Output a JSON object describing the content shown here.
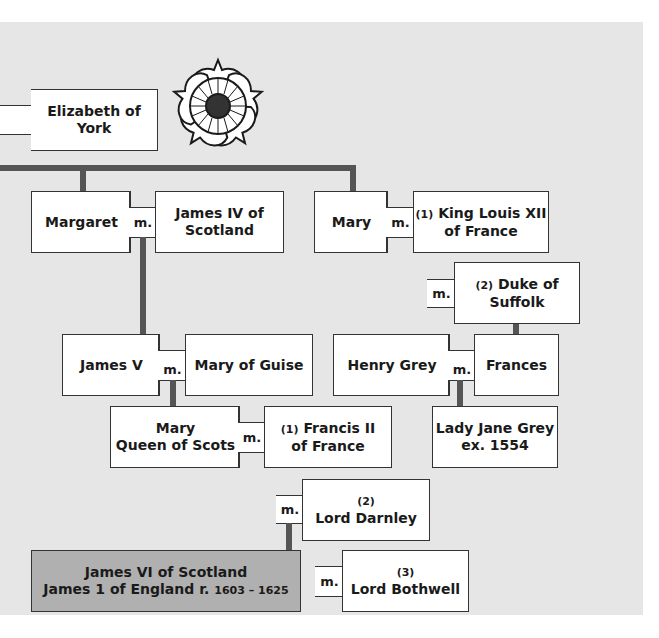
{
  "icon": "tudor-rose-icon",
  "colors": {
    "panel": "#e6e6e6",
    "line": "#555555",
    "highlight": "#b0b0b0",
    "border": "#333333"
  },
  "marriage_label": "m.",
  "people": {
    "elizabeth": {
      "line1": "Elizabeth of",
      "line2": "York"
    },
    "margaret": "Margaret",
    "james4": {
      "line1": "James IV of",
      "line2": "Scotland"
    },
    "mary_tudor": "Mary",
    "louis12": {
      "num": "(1)",
      "line1": "King Louis XII",
      "line2": "of France"
    },
    "suffolk": {
      "num": "(2)",
      "line1": "Duke of",
      "line2": "Suffolk"
    },
    "james5": "James V",
    "guise": "Mary of Guise",
    "henry_grey": "Henry Grey",
    "frances": "Frances",
    "mqos": {
      "line1": "Mary",
      "line2": "Queen of Scots"
    },
    "francis2": {
      "num": "(1)",
      "line1": "Francis II",
      "line2": "of France"
    },
    "jane_grey": {
      "line1": "Lady Jane Grey",
      "line2": "ex. 1554"
    },
    "darnley": {
      "num": "(2)",
      "line1": "Lord Darnley"
    },
    "james6": {
      "line1": "James VI of Scotland",
      "line2": "James 1 of England r.",
      "reign": "1603 – 1625"
    },
    "bothwell": {
      "num": "(3)",
      "line1": "Lord Bothwell"
    }
  }
}
